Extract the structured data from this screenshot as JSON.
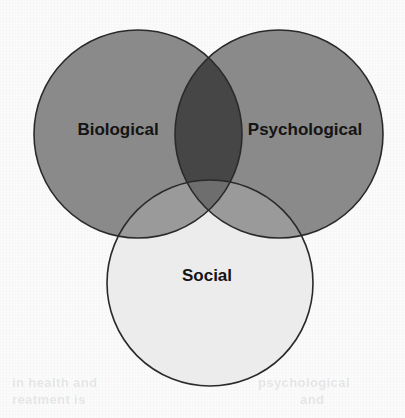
{
  "figure": {
    "type": "venn-diagram",
    "set_count": 3,
    "background_color": "#fbfbfb",
    "stroke_color": "#2a2a2a",
    "label_color": "#141414"
  },
  "chart_data": {
    "type": "venn",
    "sets": [
      {
        "id": "biological",
        "label": "Biological",
        "cx": 138,
        "cy": 134,
        "r": 104,
        "fill": "#8a8a8a",
        "label_x": 118,
        "label_y": 131,
        "font_size": 17
      },
      {
        "id": "psychological",
        "label": "Psychological",
        "cx": 279,
        "cy": 134,
        "r": 104,
        "fill": "#8a8a8a",
        "label_x": 305,
        "label_y": 131,
        "font_size": 17
      },
      {
        "id": "social",
        "label": "Social",
        "cx": 210,
        "cy": 283,
        "r": 103,
        "fill": "#ececec",
        "label_x": 207,
        "label_y": 277,
        "font_size": 17
      }
    ],
    "intersections": [
      {
        "id": "biological-psychological",
        "members": [
          "biological",
          "psychological"
        ],
        "fill": "#464646",
        "label": ""
      },
      {
        "id": "biological-social",
        "members": [
          "biological",
          "social"
        ],
        "fill": "#9a9a9a",
        "label": ""
      },
      {
        "id": "psychological-social",
        "members": [
          "psychological",
          "social"
        ],
        "fill": "#9a9a9a",
        "label": ""
      },
      {
        "id": "biological-psychological-social",
        "members": [
          "biological",
          "psychological",
          "social"
        ],
        "fill": "#6e6e6e",
        "label": ""
      }
    ],
    "legend": null,
    "grid": false,
    "annotations": []
  },
  "bleed": {
    "lines": [
      {
        "text": "in health and",
        "x": 12,
        "y": 382,
        "size": 13
      },
      {
        "text": "reatment is",
        "x": 12,
        "y": 399,
        "size": 13
      },
      {
        "text": "psychological",
        "x": 262,
        "y": 382,
        "size": 13
      },
      {
        "text": "and",
        "x": 300,
        "y": 399,
        "size": 13
      }
    ]
  }
}
